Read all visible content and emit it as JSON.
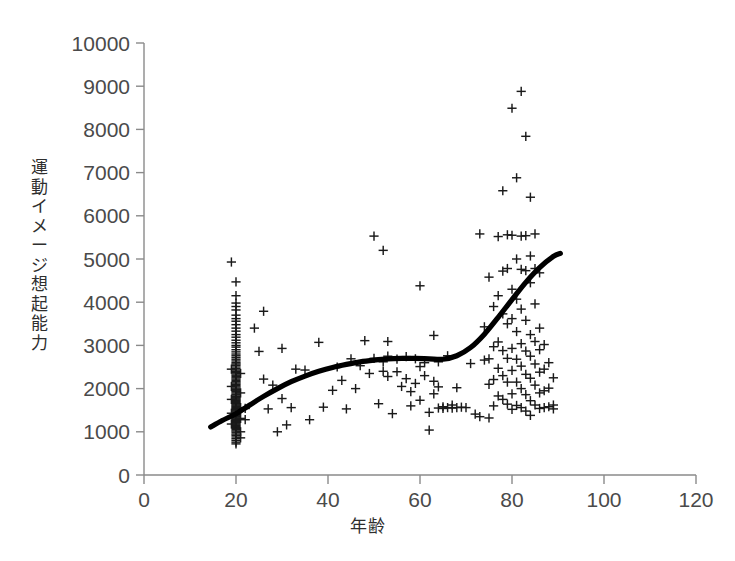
{
  "chart_data": {
    "type": "scatter",
    "title": "",
    "xlabel": "年齢",
    "ylabel": "運動イメージ想起能力",
    "xlim": [
      0,
      120
    ],
    "ylim": [
      0,
      10000
    ],
    "xticks": [
      0,
      20,
      40,
      60,
      80,
      100,
      120
    ],
    "yticks": [
      0,
      1000,
      2000,
      3000,
      4000,
      5000,
      6000,
      7000,
      8000,
      9000,
      10000
    ],
    "grid": false,
    "legend": null,
    "marker": "plus",
    "marker_color": "#1a1a1a",
    "points": [
      [
        19,
        4930
      ],
      [
        20,
        4470
      ],
      [
        20,
        4150
      ],
      [
        20,
        3980
      ],
      [
        20,
        3900
      ],
      [
        20,
        3820
      ],
      [
        20,
        3700
      ],
      [
        20,
        3620
      ],
      [
        20,
        3560
      ],
      [
        20,
        3480
      ],
      [
        20,
        3400
      ],
      [
        20,
        3330
      ],
      [
        20,
        3250
      ],
      [
        20,
        3190
      ],
      [
        20,
        3120
      ],
      [
        20,
        3060
      ],
      [
        20,
        3000
      ],
      [
        20,
        2960
      ],
      [
        20,
        2900
      ],
      [
        20,
        2850
      ],
      [
        20,
        2800
      ],
      [
        20,
        2760
      ],
      [
        20,
        2720
      ],
      [
        20,
        2680
      ],
      [
        20,
        2640
      ],
      [
        20,
        2600
      ],
      [
        20,
        2570
      ],
      [
        20,
        2540
      ],
      [
        20,
        2500
      ],
      [
        20,
        2460
      ],
      [
        20,
        2430
      ],
      [
        20,
        2400
      ],
      [
        20,
        2370
      ],
      [
        20,
        2340
      ],
      [
        20,
        2310
      ],
      [
        20,
        2280
      ],
      [
        20,
        2250
      ],
      [
        20,
        2220
      ],
      [
        20,
        2190
      ],
      [
        20,
        2160
      ],
      [
        20,
        2130
      ],
      [
        20,
        2100
      ],
      [
        20,
        2070
      ],
      [
        20,
        2040
      ],
      [
        20,
        2010
      ],
      [
        20,
        1980
      ],
      [
        20,
        1950
      ],
      [
        20,
        1930
      ],
      [
        20,
        1900
      ],
      [
        20,
        1870
      ],
      [
        20,
        1850
      ],
      [
        20,
        1820
      ],
      [
        20,
        1800
      ],
      [
        20,
        1780
      ],
      [
        20,
        1760
      ],
      [
        20,
        1740
      ],
      [
        20,
        1720
      ],
      [
        20,
        1700
      ],
      [
        20,
        1680
      ],
      [
        20,
        1660
      ],
      [
        20,
        1640
      ],
      [
        20,
        1620
      ],
      [
        20,
        1600
      ],
      [
        20,
        1580
      ],
      [
        20,
        1560
      ],
      [
        20,
        1540
      ],
      [
        20,
        1520
      ],
      [
        20,
        1500
      ],
      [
        20,
        1480
      ],
      [
        20,
        1460
      ],
      [
        20,
        1440
      ],
      [
        20,
        1420
      ],
      [
        20,
        1400
      ],
      [
        20,
        1380
      ],
      [
        20,
        1360
      ],
      [
        20,
        1340
      ],
      [
        20,
        1320
      ],
      [
        20,
        1300
      ],
      [
        20,
        1280
      ],
      [
        20,
        1260
      ],
      [
        20,
        1240
      ],
      [
        20,
        1220
      ],
      [
        20,
        1200
      ],
      [
        20,
        1180
      ],
      [
        20,
        1160
      ],
      [
        20,
        1140
      ],
      [
        20,
        1120
      ],
      [
        20,
        1100
      ],
      [
        20,
        1080
      ],
      [
        20,
        1050
      ],
      [
        20,
        1020
      ],
      [
        20,
        990
      ],
      [
        20,
        950
      ],
      [
        20,
        920
      ],
      [
        20,
        880
      ],
      [
        20,
        840
      ],
      [
        20,
        800
      ],
      [
        20,
        760
      ],
      [
        20,
        720
      ],
      [
        19,
        2450
      ],
      [
        19,
        2050
      ],
      [
        19,
        1750
      ],
      [
        19,
        1430
      ],
      [
        19,
        1180
      ],
      [
        21,
        2350
      ],
      [
        21,
        1900
      ],
      [
        21,
        1560
      ],
      [
        21,
        1310
      ],
      [
        21,
        1000
      ],
      [
        21,
        860
      ],
      [
        22,
        1540
      ],
      [
        22,
        1280
      ],
      [
        24,
        3400
      ],
      [
        25,
        2860
      ],
      [
        26,
        3790
      ],
      [
        26,
        2220
      ],
      [
        27,
        1530
      ],
      [
        28,
        2080
      ],
      [
        29,
        1000
      ],
      [
        30,
        1770
      ],
      [
        30,
        2930
      ],
      [
        31,
        1160
      ],
      [
        32,
        1560
      ],
      [
        33,
        2450
      ],
      [
        35,
        2430
      ],
      [
        36,
        1280
      ],
      [
        38,
        3070
      ],
      [
        39,
        1570
      ],
      [
        41,
        1960
      ],
      [
        42,
        2500
      ],
      [
        43,
        2190
      ],
      [
        44,
        1530
      ],
      [
        45,
        2690
      ],
      [
        46,
        2000
      ],
      [
        47,
        2530
      ],
      [
        48,
        3110
      ],
      [
        49,
        2350
      ],
      [
        50,
        5530
      ],
      [
        50,
        2700
      ],
      [
        51,
        1650
      ],
      [
        52,
        5200
      ],
      [
        52,
        2620
      ],
      [
        52,
        2400
      ],
      [
        53,
        3090
      ],
      [
        53,
        2750
      ],
      [
        53,
        2280
      ],
      [
        54,
        1420
      ],
      [
        55,
        2680
      ],
      [
        55,
        2390
      ],
      [
        56,
        2050
      ],
      [
        57,
        2740
      ],
      [
        57,
        2230
      ],
      [
        58,
        1930
      ],
      [
        58,
        1600
      ],
      [
        59,
        2690
      ],
      [
        59,
        2120
      ],
      [
        60,
        4380
      ],
      [
        60,
        2510
      ],
      [
        60,
        1730
      ],
      [
        61,
        2600
      ],
      [
        61,
        2300
      ],
      [
        62,
        1450
      ],
      [
        62,
        1040
      ],
      [
        63,
        3230
      ],
      [
        63,
        2170
      ],
      [
        63,
        1880
      ],
      [
        64,
        2620
      ],
      [
        64,
        2040
      ],
      [
        64,
        1550
      ],
      [
        65,
        1580
      ],
      [
        65,
        1540
      ],
      [
        66,
        1560
      ],
      [
        66,
        2760
      ],
      [
        67,
        1620
      ],
      [
        67,
        1550
      ],
      [
        68,
        2020
      ],
      [
        68,
        1560
      ],
      [
        69,
        1570
      ],
      [
        70,
        1560
      ],
      [
        71,
        2580
      ],
      [
        72,
        1410
      ],
      [
        73,
        5580
      ],
      [
        73,
        1350
      ],
      [
        74,
        3430
      ],
      [
        74,
        2660
      ],
      [
        75,
        4580
      ],
      [
        75,
        2690
      ],
      [
        75,
        2100
      ],
      [
        75,
        1320
      ],
      [
        76,
        3900
      ],
      [
        76,
        2970
      ],
      [
        76,
        2210
      ],
      [
        76,
        1600
      ],
      [
        77,
        5520
      ],
      [
        77,
        4150
      ],
      [
        77,
        3080
      ],
      [
        77,
        2470
      ],
      [
        77,
        1830
      ],
      [
        78,
        6580
      ],
      [
        78,
        4720
      ],
      [
        78,
        3730
      ],
      [
        78,
        2880
      ],
      [
        78,
        2300
      ],
      [
        78,
        1750
      ],
      [
        79,
        5560
      ],
      [
        79,
        4780
      ],
      [
        79,
        3500
      ],
      [
        79,
        2700
      ],
      [
        79,
        2150
      ],
      [
        79,
        1640
      ],
      [
        80,
        8490
      ],
      [
        80,
        5550
      ],
      [
        80,
        4300
      ],
      [
        80,
        3620
      ],
      [
        80,
        2930
      ],
      [
        80,
        2420
      ],
      [
        80,
        1880
      ],
      [
        80,
        1520
      ],
      [
        81,
        6880
      ],
      [
        81,
        5000
      ],
      [
        81,
        4070
      ],
      [
        81,
        3320
      ],
      [
        81,
        2680
      ],
      [
        81,
        2150
      ],
      [
        81,
        1610
      ],
      [
        82,
        8880
      ],
      [
        82,
        5530
      ],
      [
        82,
        4760
      ],
      [
        82,
        3840
      ],
      [
        82,
        3040
      ],
      [
        82,
        2520
      ],
      [
        82,
        2000
      ],
      [
        82,
        1560
      ],
      [
        83,
        7840
      ],
      [
        83,
        5540
      ],
      [
        83,
        4730
      ],
      [
        83,
        3580
      ],
      [
        83,
        2870
      ],
      [
        83,
        2330
      ],
      [
        83,
        1860
      ],
      [
        83,
        1480
      ],
      [
        84,
        6430
      ],
      [
        84,
        5070
      ],
      [
        84,
        4450
      ],
      [
        84,
        3250
      ],
      [
        84,
        2750
      ],
      [
        84,
        2240
      ],
      [
        84,
        1720
      ],
      [
        84,
        1380
      ],
      [
        85,
        5580
      ],
      [
        85,
        4780
      ],
      [
        85,
        3960
      ],
      [
        85,
        3090
      ],
      [
        85,
        2570
      ],
      [
        85,
        2080
      ],
      [
        85,
        1620
      ],
      [
        86,
        4680
      ],
      [
        86,
        3400
      ],
      [
        86,
        2900
      ],
      [
        86,
        2380
      ],
      [
        86,
        1900
      ],
      [
        86,
        1540
      ],
      [
        87,
        3020
      ],
      [
        87,
        2450
      ],
      [
        87,
        1950
      ],
      [
        87,
        1560
      ],
      [
        88,
        2600
      ],
      [
        88,
        2010
      ],
      [
        88,
        1580
      ],
      [
        89,
        2250
      ],
      [
        89,
        1620
      ],
      [
        89,
        1530
      ]
    ],
    "trend": {
      "type": "loess-smooth",
      "color": "#000000",
      "points": [
        [
          14.5,
          1110
        ],
        [
          17,
          1260
        ],
        [
          20,
          1420
        ],
        [
          23,
          1620
        ],
        [
          26,
          1820
        ],
        [
          29,
          2000
        ],
        [
          32,
          2160
        ],
        [
          35,
          2290
        ],
        [
          38,
          2400
        ],
        [
          41,
          2490
        ],
        [
          44,
          2560
        ],
        [
          47,
          2620
        ],
        [
          50,
          2660
        ],
        [
          53,
          2690
        ],
        [
          56,
          2700
        ],
        [
          59,
          2700
        ],
        [
          62,
          2690
        ],
        [
          65,
          2680
        ],
        [
          68,
          2760
        ],
        [
          71,
          2950
        ],
        [
          74,
          3260
        ],
        [
          77,
          3650
        ],
        [
          80,
          4060
        ],
        [
          83,
          4460
        ],
        [
          86,
          4800
        ],
        [
          89,
          5060
        ],
        [
          90.5,
          5130
        ]
      ]
    }
  },
  "axes": {
    "x_tick_labels": [
      "0",
      "20",
      "40",
      "60",
      "80",
      "100",
      "120"
    ],
    "y_tick_labels": [
      "0",
      "1000",
      "2000",
      "3000",
      "4000",
      "5000",
      "6000",
      "7000",
      "8000",
      "9000",
      "10000"
    ],
    "x_axis_title": "年齢",
    "y_axis_title": "運動イメージ想起能力"
  },
  "figure": {
    "background": "#ffffff",
    "axis_color": "#8a8a8a",
    "tick_text_color": "#4a4a4a",
    "title_color": "#2e2e2e"
  }
}
